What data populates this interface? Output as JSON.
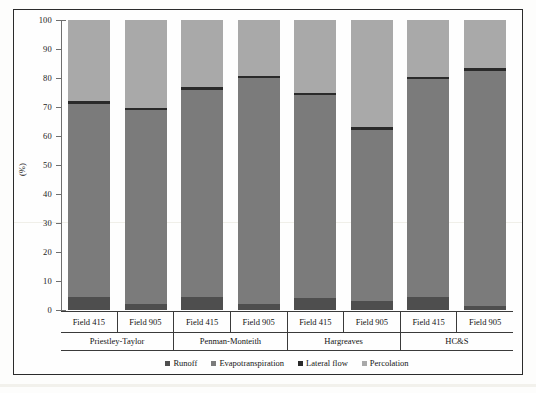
{
  "chart_data": {
    "type": "bar",
    "stacked": true,
    "title": "",
    "xlabel": "",
    "ylabel": "(%)",
    "ylim": [
      0,
      100
    ],
    "yticks": [
      0,
      10,
      20,
      30,
      40,
      50,
      60,
      70,
      80,
      90,
      100
    ],
    "grid": false,
    "legend_position": "bottom",
    "groups": [
      "Priestley-Taylor",
      "Penman-Monteith",
      "Hargreaves",
      "HC&S"
    ],
    "categories": [
      "Field 415",
      "Field 905",
      "Field 415",
      "Field 905",
      "Field 415",
      "Field 905",
      "Field 415",
      "Field 905"
    ],
    "series": [
      {
        "name": "Runoff",
        "color": "#4e4e4e",
        "values": [
          4.5,
          2.0,
          4.5,
          2.0,
          4.0,
          3.0,
          4.5,
          1.5
        ]
      },
      {
        "name": "Evapotranspiration",
        "color": "#7b7b7b",
        "values": [
          66.5,
          67.0,
          71.5,
          78.0,
          70.0,
          59.0,
          75.0,
          81.0
        ]
      },
      {
        "name": "Lateral flow",
        "color": "#2a2a2a",
        "values": [
          1.0,
          0.8,
          1.0,
          0.8,
          1.0,
          1.0,
          1.0,
          0.8
        ]
      },
      {
        "name": "Percolation",
        "color": "#a9a9a9",
        "values": [
          28.0,
          30.2,
          23.0,
          19.2,
          25.0,
          37.0,
          19.5,
          16.7
        ]
      }
    ]
  },
  "axis": {
    "ylabel": "(%)",
    "tick_labels": [
      "100",
      "90",
      "80",
      "70",
      "60",
      "50",
      "40",
      "30",
      "20",
      "10",
      "0"
    ]
  },
  "legend": {
    "items": [
      {
        "label": "Runoff",
        "color": "#4e4e4e"
      },
      {
        "label": "Evapotranspiration",
        "color": "#7b7b7b"
      },
      {
        "label": "Lateral flow",
        "color": "#2a2a2a"
      },
      {
        "label": "Percolation",
        "color": "#a9a9a9"
      }
    ]
  },
  "category_axis": {
    "fields": [
      "Field 415",
      "Field 905",
      "Field 415",
      "Field 905",
      "Field 415",
      "Field 905",
      "Field 415",
      "Field 905"
    ],
    "methods": [
      "Priestley-Taylor",
      "Penman-Monteith",
      "Hargreaves",
      "HC&S"
    ]
  }
}
